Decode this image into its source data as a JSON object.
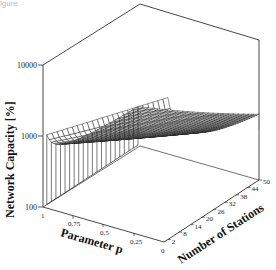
{
  "caption_fragment": "igure",
  "chart_data": {
    "type": "surface3d",
    "title": "",
    "xlabel": "Parameter p",
    "ylabel": "Number of Stations",
    "zlabel": "Network Capacity [%]",
    "z_scale": "log",
    "zlim": [
      100,
      10000
    ],
    "x_ticks": [
      "1",
      "0,75",
      "0,5",
      "0,25",
      "0"
    ],
    "x_range": [
      1,
      0
    ],
    "y_ticks": [
      "2",
      "8",
      "14",
      "20",
      "26",
      "32",
      "38",
      "44",
      "50"
    ],
    "y_origin_label": "0",
    "y_range": [
      0,
      50
    ],
    "z_ticks": [
      "100",
      "1000",
      "10000"
    ],
    "grid": false,
    "series": [
      {
        "name": "p=1",
        "stations": [
          2,
          8,
          14,
          20,
          26,
          32,
          38,
          44,
          50
        ],
        "values": [
          1000,
          700,
          550,
          450,
          400,
          360,
          330,
          310,
          300
        ]
      },
      {
        "name": "p=0.75",
        "stations": [
          2,
          8,
          14,
          20,
          26,
          32,
          38,
          44,
          50
        ],
        "values": [
          2200,
          1100,
          750,
          600,
          500,
          430,
          390,
          360,
          340
        ]
      },
      {
        "name": "p=0.5",
        "stations": [
          2,
          8,
          14,
          20,
          26,
          32,
          38,
          44,
          50
        ],
        "values": [
          4000,
          1600,
          1000,
          750,
          600,
          520,
          460,
          420,
          390
        ]
      },
      {
        "name": "p=0.25",
        "stations": [
          2,
          8,
          14,
          20,
          26,
          32,
          38,
          44,
          50
        ],
        "values": [
          7000,
          2300,
          1300,
          950,
          750,
          630,
          550,
          500,
          460
        ]
      },
      {
        "name": "p=0",
        "stations": [
          2,
          8,
          14,
          20,
          26,
          32,
          38,
          44,
          50
        ],
        "values": [
          10000,
          3000,
          1700,
          1200,
          900,
          750,
          650,
          580,
          520
        ]
      }
    ]
  }
}
